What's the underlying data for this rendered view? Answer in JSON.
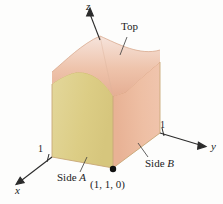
{
  "figure": {
    "kind": "3d-solid-region-diagram",
    "background_color": "#fdfdfc"
  },
  "axes": {
    "z": {
      "name": "z",
      "origin": [
        113,
        115
      ],
      "tip": [
        90,
        10
      ]
    },
    "y": {
      "name": "y",
      "origin": [
        113,
        168
      ],
      "tip": [
        205,
        145
      ]
    },
    "x": {
      "name": "x",
      "origin": [
        113,
        168
      ],
      "tip": [
        17,
        182
      ]
    }
  },
  "ticks": [
    {
      "name": "x-tick-1",
      "label": "1",
      "x": 38,
      "y": 146
    },
    {
      "name": "y-tick-1",
      "label": "1",
      "x": 160,
      "y": 121
    }
  ],
  "callouts": [
    {
      "name": "top-label",
      "text": "Top",
      "x": 121,
      "y": 26
    },
    {
      "name": "side-a-label",
      "text": "Side A",
      "italic_part": "A",
      "x": 60,
      "y": 174
    },
    {
      "name": "side-b-label",
      "text": "Side B",
      "italic_part": "B",
      "x": 146,
      "y": 159
    }
  ],
  "point": {
    "name": "corner-point",
    "label": "(1, 1, 0)",
    "dot": [
      113,
      169
    ],
    "label_x": 92,
    "label_y": 179
  },
  "colors": {
    "side_a_face": "#ddd08a",
    "side_b_face": "#eab79a",
    "top_surface_light": "#f3ded4",
    "top_surface_mid": "#e9b9a1",
    "floor": "#f1ede1",
    "axis_line": "#2b2b2b",
    "edge_line": "#b08a70",
    "dashed_line": "#a89878"
  }
}
